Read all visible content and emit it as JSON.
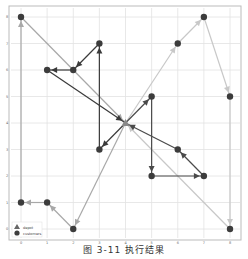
{
  "chart_data": {
    "type": "line",
    "title": "",
    "caption": "图 3-11   执行结果",
    "xlabel": "",
    "ylabel": "",
    "xlim": [
      0,
      8
    ],
    "ylim": [
      0,
      8
    ],
    "x_ticks": [
      "0",
      "1",
      "2",
      "3",
      "4",
      "5",
      "6",
      "7",
      "8"
    ],
    "y_ticks": [
      "0",
      "1",
      "2",
      "3",
      "4",
      "5",
      "6",
      "7",
      "8"
    ],
    "grid": true,
    "legend": {
      "position": "lower left",
      "entries": [
        "depot",
        "customers"
      ]
    },
    "depot": [
      4,
      4
    ],
    "customers": [
      [
        0,
        8
      ],
      [
        7,
        8
      ],
      [
        3,
        7
      ],
      [
        6,
        7
      ],
      [
        1,
        6
      ],
      [
        2,
        6
      ],
      [
        5,
        5
      ],
      [
        8,
        5
      ],
      [
        3,
        3
      ],
      [
        6,
        3
      ],
      [
        5,
        2
      ],
      [
        7,
        2
      ],
      [
        0,
        1
      ],
      [
        1,
        1
      ],
      [
        2,
        0
      ],
      [
        8,
        0
      ]
    ],
    "series": [
      {
        "name": "route-1",
        "color": "#a8a8a8",
        "points": [
          [
            4,
            4
          ],
          [
            2,
            0
          ],
          [
            1,
            1
          ],
          [
            0,
            1
          ],
          [
            0,
            8
          ],
          [
            4,
            4
          ]
        ]
      },
      {
        "name": "route-2",
        "color": "#3a3a3a",
        "points": [
          [
            4,
            4
          ],
          [
            3,
            3
          ],
          [
            3,
            7
          ],
          [
            2,
            6
          ],
          [
            1,
            6
          ],
          [
            4,
            4
          ]
        ]
      },
      {
        "name": "route-3",
        "color": "#c8c8c8",
        "points": [
          [
            4,
            4
          ],
          [
            6,
            7
          ],
          [
            7,
            8
          ],
          [
            8,
            5
          ],
          [
            8,
            0
          ],
          [
            4,
            4
          ]
        ]
      },
      {
        "name": "route-4",
        "color": "#4a4a4a",
        "points": [
          [
            4,
            4
          ],
          [
            5,
            5
          ],
          [
            5,
            2
          ],
          [
            7,
            2
          ],
          [
            6,
            3
          ],
          [
            4,
            4
          ]
        ]
      }
    ]
  }
}
